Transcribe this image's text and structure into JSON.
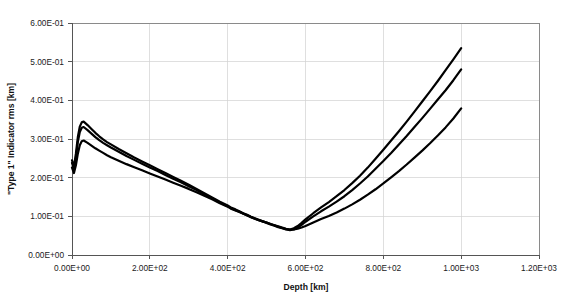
{
  "chart_data": {
    "type": "line",
    "title": "",
    "xlabel": "Depth [km]",
    "ylabel": "\"Type 1\" Indicator rms [km]",
    "xlim": [
      0,
      1200
    ],
    "ylim": [
      0,
      0.6
    ],
    "grid": true,
    "legend": "none",
    "xticks": [
      "0.00E+00",
      "2.00E+02",
      "4.00E+02",
      "6.00E+02",
      "8.00E+02",
      "1.00E+03",
      "1.20E+03"
    ],
    "xtick_values": [
      0,
      200,
      400,
      600,
      800,
      1000,
      1200
    ],
    "yticks": [
      "0.00E+00",
      "1.00E-01",
      "2.00E-01",
      "3.00E-01",
      "4.00E-01",
      "5.00E-01",
      "6.00E-01"
    ],
    "ytick_values": [
      0,
      0.1,
      0.2,
      0.3,
      0.4,
      0.5,
      0.6
    ],
    "series_color": "#000000",
    "x": [
      0,
      5,
      10,
      15,
      20,
      25,
      30,
      40,
      50,
      60,
      70,
      80,
      90,
      100,
      120,
      140,
      160,
      180,
      200,
      220,
      240,
      260,
      280,
      300,
      320,
      340,
      360,
      380,
      400,
      410,
      420,
      430,
      440,
      450,
      460,
      470,
      480,
      490,
      500,
      510,
      520,
      530,
      540,
      550,
      560,
      570,
      580,
      590,
      600,
      620,
      640,
      660,
      680,
      700,
      720,
      740,
      760,
      780,
      800,
      820,
      840,
      860,
      880,
      900,
      920,
      940,
      960,
      980,
      1000
    ],
    "series": [
      {
        "name": "curve-upper",
        "values": [
          0.245,
          0.228,
          0.262,
          0.305,
          0.332,
          0.343,
          0.345,
          0.336,
          0.326,
          0.316,
          0.307,
          0.299,
          0.292,
          0.286,
          0.274,
          0.263,
          0.252,
          0.242,
          0.232,
          0.222,
          0.212,
          0.202,
          0.192,
          0.182,
          0.171,
          0.16,
          0.149,
          0.138,
          0.128,
          0.122,
          0.118,
          0.113,
          0.108,
          0.104,
          0.099,
          0.095,
          0.091,
          0.087,
          0.084,
          0.08,
          0.077,
          0.073,
          0.07,
          0.067,
          0.066,
          0.069,
          0.075,
          0.083,
          0.092,
          0.108,
          0.123,
          0.137,
          0.152,
          0.168,
          0.186,
          0.205,
          0.226,
          0.249,
          0.272,
          0.296,
          0.32,
          0.345,
          0.371,
          0.397,
          0.423,
          0.45,
          0.478,
          0.506,
          0.535
        ]
      },
      {
        "name": "curve-middle",
        "values": [
          0.238,
          0.222,
          0.252,
          0.292,
          0.318,
          0.329,
          0.331,
          0.323,
          0.314,
          0.305,
          0.297,
          0.29,
          0.284,
          0.278,
          0.267,
          0.256,
          0.246,
          0.236,
          0.226,
          0.217,
          0.207,
          0.197,
          0.188,
          0.178,
          0.168,
          0.157,
          0.147,
          0.136,
          0.126,
          0.12,
          0.116,
          0.112,
          0.107,
          0.103,
          0.098,
          0.094,
          0.09,
          0.087,
          0.083,
          0.079,
          0.076,
          0.072,
          0.069,
          0.066,
          0.064,
          0.066,
          0.071,
          0.078,
          0.086,
          0.1,
          0.113,
          0.125,
          0.138,
          0.152,
          0.168,
          0.185,
          0.203,
          0.223,
          0.243,
          0.264,
          0.286,
          0.308,
          0.331,
          0.354,
          0.378,
          0.402,
          0.426,
          0.452,
          0.48
        ]
      },
      {
        "name": "curve-lower",
        "values": [
          0.226,
          0.212,
          0.232,
          0.262,
          0.284,
          0.294,
          0.296,
          0.29,
          0.283,
          0.276,
          0.27,
          0.264,
          0.258,
          0.253,
          0.244,
          0.235,
          0.227,
          0.219,
          0.211,
          0.203,
          0.195,
          0.187,
          0.179,
          0.171,
          0.162,
          0.153,
          0.144,
          0.134,
          0.125,
          0.119,
          0.115,
          0.111,
          0.107,
          0.102,
          0.098,
          0.094,
          0.09,
          0.087,
          0.084,
          0.08,
          0.077,
          0.074,
          0.071,
          0.068,
          0.066,
          0.066,
          0.068,
          0.071,
          0.075,
          0.084,
          0.093,
          0.101,
          0.11,
          0.12,
          0.131,
          0.143,
          0.156,
          0.17,
          0.185,
          0.201,
          0.217,
          0.234,
          0.252,
          0.27,
          0.289,
          0.309,
          0.33,
          0.353,
          0.379
        ]
      }
    ]
  }
}
